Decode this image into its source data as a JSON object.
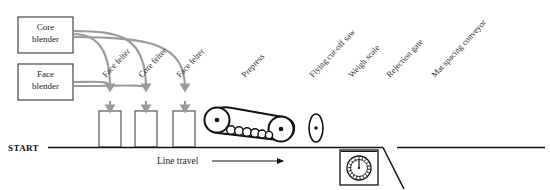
{
  "diagram": {
    "colors": {
      "line": "#111111",
      "flow_arrow": "#9a9a9a",
      "box_stroke": "#333333",
      "machine_stroke": "#111111",
      "text": "#1a1a1a",
      "background": "#ffffff"
    },
    "blenders": [
      {
        "id": "core-blender",
        "line1": "Core",
        "line2": "blender"
      },
      {
        "id": "face-blender",
        "line1": "Face",
        "line2": "blender"
      }
    ],
    "felters": [
      {
        "id": "felter-1",
        "label": "Face  felter"
      },
      {
        "id": "felter-2",
        "label": "Core  felter"
      },
      {
        "id": "felter-3",
        "label": "Face  felter"
      }
    ],
    "stations": [
      {
        "id": "prepress",
        "label": "Prepress"
      },
      {
        "id": "flying-cutoff-saw",
        "label": "Flying  cut-off  saw"
      },
      {
        "id": "weigh-scale",
        "label": "Weigh scale"
      },
      {
        "id": "rejection-gate",
        "label": "Rejection gate"
      },
      {
        "id": "mat-spacing-conveyor",
        "label": "Mat  spacing  conveyor"
      }
    ],
    "baseline": {
      "start_label": "START",
      "travel_label": "Line  travel"
    }
  }
}
